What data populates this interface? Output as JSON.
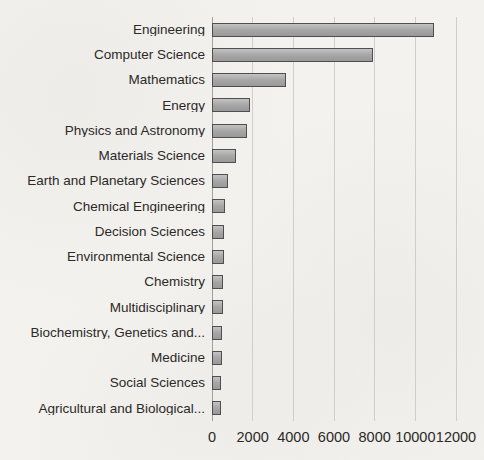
{
  "chart_data": {
    "type": "bar",
    "orientation": "horizontal",
    "title": "",
    "xlabel": "",
    "ylabel": "",
    "categories": [
      "Engineering",
      "Computer Science",
      "Mathematics",
      "Energy",
      "Physics and Astronomy",
      "Materials Science",
      "Earth and Planetary Sciences",
      "Chemical Engineering",
      "Decision Sciences",
      "Environmental Science",
      "Chemistry",
      "Multidisciplinary",
      "Biochemistry, Genetics and...",
      "Medicine",
      "Social Sciences",
      "Agricultural and Biological..."
    ],
    "values": [
      10900,
      7900,
      3650,
      1850,
      1700,
      1180,
      800,
      620,
      590,
      570,
      550,
      520,
      500,
      470,
      450,
      430
    ],
    "xlim": [
      0,
      12000
    ],
    "x_ticks": [
      0,
      2000,
      4000,
      6000,
      8000,
      10000,
      12000
    ],
    "grid": "vertical-gridlines-on",
    "legend": "none"
  },
  "style": {
    "background": "#f4f2ef",
    "bar_fill": "#a6a6a6",
    "bar_border": "#4f4f4f",
    "gridline": "#d0cecb",
    "axis_line": "#a3a19d",
    "text_color": "#2b2a28"
  }
}
